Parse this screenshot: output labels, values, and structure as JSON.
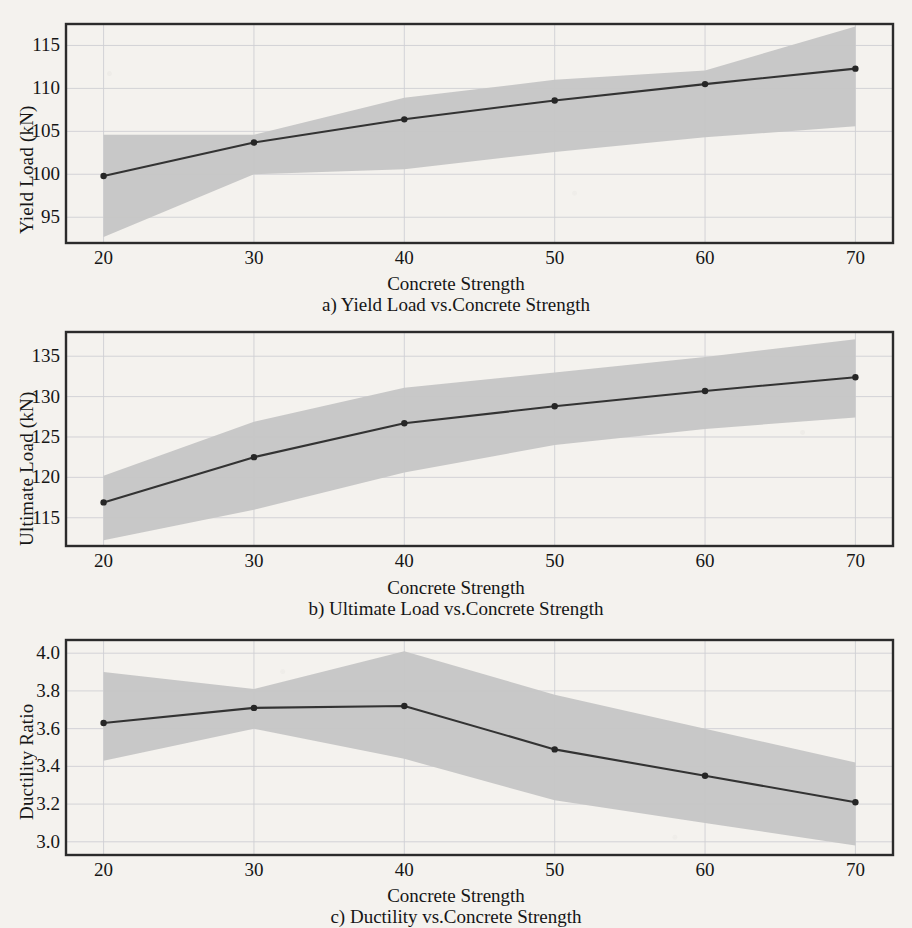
{
  "figure": {
    "xlabel": "Concrete Strength",
    "x_categories": [
      20,
      30,
      40,
      50,
      60,
      70
    ],
    "band_color": "#c6c6c6",
    "line_color": "#333333",
    "page_background": "#f4f2ee"
  },
  "panels": [
    {
      "id": "panel-yield-load",
      "caption": "a) Yield Load vs.Concrete Strength",
      "ylabel": "Yield Load (kN)",
      "xlabel": "Concrete Strength",
      "yticks": [
        "95",
        "100",
        "105",
        "110",
        "115"
      ],
      "xticks": [
        "20",
        "30",
        "40",
        "50",
        "60",
        "70"
      ]
    },
    {
      "id": "panel-ultimate-load",
      "caption": "b) Ultimate Load vs.Concrete Strength",
      "ylabel": "Ultimate Load (kN)",
      "xlabel": "Concrete Strength",
      "yticks": [
        "115",
        "120",
        "125",
        "130",
        "135"
      ],
      "xticks": [
        "20",
        "30",
        "40",
        "50",
        "60",
        "70"
      ]
    },
    {
      "id": "panel-ductility-ratio",
      "caption": "c) Ductility vs.Concrete Strength",
      "ylabel": "Ductility Ratio",
      "xlabel": "Concrete Strength",
      "yticks": [
        "3.0",
        "3.2",
        "3.4",
        "3.6",
        "3.8",
        "4.0"
      ],
      "xticks": [
        "20",
        "30",
        "40",
        "50",
        "60",
        "70"
      ]
    }
  ],
  "chart_data": [
    {
      "type": "line",
      "title": "a) Yield Load vs.Concrete Strength",
      "xlabel": "Concrete Strength",
      "ylabel": "Yield Load (kN)",
      "x": [
        20,
        30,
        40,
        50,
        60,
        70
      ],
      "xlim": [
        17.5,
        72.5
      ],
      "ylim": [
        92.0,
        117.5
      ],
      "ytick_values": [
        95,
        100,
        105,
        110,
        115
      ],
      "grid": true,
      "legend": "none",
      "series": [
        {
          "name": "Yield Load (mean)",
          "values": [
            99.8,
            103.7,
            106.4,
            108.6,
            110.5,
            112.3
          ],
          "marker": "circle"
        }
      ],
      "band": {
        "name": "confidence band",
        "upper": [
          104.6,
          104.6,
          108.9,
          111.0,
          112.1,
          117.2
        ],
        "lower": [
          92.7,
          100.0,
          100.6,
          102.6,
          104.3,
          105.6
        ],
        "fill": "#c6c6c6"
      }
    },
    {
      "type": "line",
      "title": "b) Ultimate Load vs.Concrete Strength",
      "xlabel": "Concrete Strength",
      "ylabel": "Ultimate Load (kN)",
      "x": [
        20,
        30,
        40,
        50,
        60,
        70
      ],
      "xlim": [
        17.5,
        72.5
      ],
      "ylim": [
        111.5,
        138.0
      ],
      "ytick_values": [
        115,
        120,
        125,
        130,
        135
      ],
      "grid": true,
      "legend": "none",
      "series": [
        {
          "name": "Ultimate Load (mean)",
          "values": [
            116.9,
            122.5,
            126.7,
            128.8,
            130.7,
            132.4
          ],
          "marker": "circle"
        }
      ],
      "band": {
        "name": "confidence band",
        "upper": [
          120.2,
          126.9,
          131.1,
          133.0,
          134.9,
          137.1
        ],
        "lower": [
          112.2,
          116.0,
          120.6,
          124.0,
          126.0,
          127.4
        ],
        "fill": "#c6c6c6"
      }
    },
    {
      "type": "line",
      "title": "c) Ductility vs.Concrete Strength",
      "xlabel": "Concrete Strength",
      "ylabel": "Ductility Ratio",
      "x": [
        20,
        30,
        40,
        50,
        60,
        70
      ],
      "xlim": [
        17.5,
        72.5
      ],
      "ylim": [
        2.93,
        4.07
      ],
      "ytick_values": [
        3.0,
        3.2,
        3.4,
        3.6,
        3.8,
        4.0
      ],
      "grid": true,
      "legend": "none",
      "series": [
        {
          "name": "Ductility Ratio (mean)",
          "values": [
            3.63,
            3.71,
            3.72,
            3.49,
            3.35,
            3.21
          ],
          "marker": "circle"
        }
      ],
      "band": {
        "name": "confidence band",
        "upper": [
          3.9,
          3.81,
          4.01,
          3.78,
          3.6,
          3.42
        ],
        "lower": [
          3.43,
          3.6,
          3.44,
          3.22,
          3.1,
          2.98
        ],
        "fill": "#c6c6c6"
      }
    }
  ]
}
